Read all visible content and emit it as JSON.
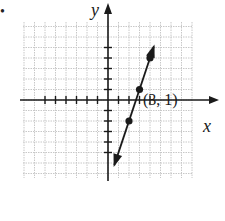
{
  "figure": {
    "bullet": "•",
    "x_axis_label": "x",
    "y_axis_label": "y",
    "point_annotation": "(3, 1)"
  },
  "colors": {
    "grid": "#c8c8c8",
    "axis": "#1a1a1a",
    "line": "#1a1a1a",
    "background": "#ffffff"
  },
  "chart_data": {
    "type": "line",
    "title": "",
    "xlabel": "x",
    "ylabel": "y",
    "xlim": [
      -9,
      10
    ],
    "ylim": [
      -6,
      6
    ],
    "grid": true,
    "legend": null,
    "series": [
      {
        "name": "line",
        "equation": "y = 3x - 8",
        "arrows": "both ends",
        "x": [
          2,
          3,
          4
        ],
        "y": [
          -2,
          1,
          4
        ],
        "marked_points": [
          [
            2,
            -2
          ],
          [
            3,
            1
          ],
          [
            4,
            4
          ]
        ]
      }
    ],
    "annotations": [
      {
        "text": "(3, 1)",
        "x": 3,
        "y": 1
      }
    ],
    "x_ticks_unlabeled": [
      -6,
      -5,
      -4,
      -3,
      -2,
      -1,
      1,
      2,
      3,
      4
    ],
    "y_ticks_unlabeled": [
      -5,
      -4,
      -3,
      -2,
      -1,
      1,
      2,
      3,
      4,
      5
    ]
  }
}
